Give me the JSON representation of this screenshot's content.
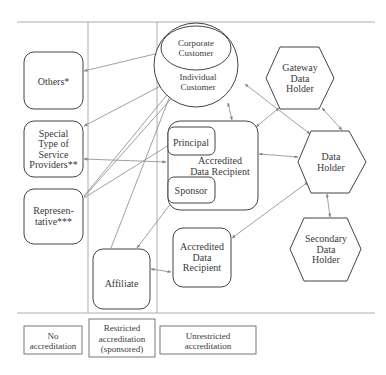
{
  "diagram": {
    "nodes": {
      "others": {
        "label": [
          "Others*"
        ]
      },
      "special_providers": {
        "label": [
          "Special",
          "Type of",
          "Service",
          "Providers**"
        ]
      },
      "representative": {
        "label": [
          "Represen-",
          "tative***"
        ]
      },
      "affiliate": {
        "label": [
          "Affiliate"
        ]
      },
      "corporate_customer": {
        "label": [
          "Corporate",
          "Customer"
        ]
      },
      "individual_customer": {
        "label": [
          "Individual",
          "Customer"
        ]
      },
      "accredited_recipient_main": {
        "label": [
          "Accredited",
          "Data Recipient"
        ]
      },
      "principal": {
        "label": [
          "Principal"
        ]
      },
      "sponsor": {
        "label": [
          "Sponsor"
        ]
      },
      "accredited_recipient_2": {
        "label": [
          "Accredited",
          "Data",
          "Recipient"
        ]
      },
      "gateway_holder": {
        "label": [
          "Gateway",
          "Data",
          "Holder"
        ]
      },
      "data_holder": {
        "label": [
          "Data",
          "Holder"
        ]
      },
      "secondary_holder": {
        "label": [
          "Secondary",
          "Data",
          "Holder"
        ]
      }
    },
    "legend": [
      {
        "label": [
          "No",
          "accreditation"
        ]
      },
      {
        "label": [
          "Restricted",
          "accreditation",
          "(sponsored)"
        ]
      },
      {
        "label": [
          "Unrestricted",
          "accreditation"
        ]
      }
    ],
    "colors": {
      "stroke": "#444444",
      "arrow": "#888888",
      "divider": "#999999"
    }
  }
}
